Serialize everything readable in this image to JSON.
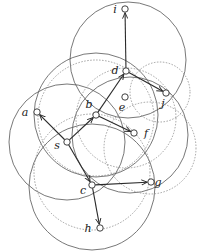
{
  "diagram": {
    "type": "graph-with-coverage-circles",
    "colors": {
      "stroke": "#555555",
      "edge": "#2a2a2a",
      "node_fill": "#ffffff",
      "label": "#222222"
    },
    "nodes": [
      {
        "id": "i",
        "label": "i",
        "x": 125,
        "y": 9,
        "lx": -10,
        "ly": 4
      },
      {
        "id": "d",
        "label": "d",
        "x": 126,
        "y": 71,
        "lx": -11,
        "ly": 3
      },
      {
        "id": "j",
        "label": "j",
        "x": 166,
        "y": 93,
        "lx": -3,
        "ly": 14
      },
      {
        "id": "e",
        "label": "e",
        "x": 125,
        "y": 97,
        "lx": -3,
        "ly": 14
      },
      {
        "id": "a",
        "label": "a",
        "x": 37,
        "y": 112,
        "lx": -12,
        "ly": 4
      },
      {
        "id": "b",
        "label": "b",
        "x": 96,
        "y": 115,
        "lx": -7,
        "ly": -7
      },
      {
        "id": "f",
        "label": "f",
        "x": 134,
        "y": 133,
        "lx": 12,
        "ly": 4
      },
      {
        "id": "s",
        "label": "s",
        "x": 67,
        "y": 142,
        "lx": -10,
        "ly": 7
      },
      {
        "id": "c",
        "label": "c",
        "x": 92,
        "y": 185,
        "lx": -9,
        "ly": 9
      },
      {
        "id": "g",
        "label": "g",
        "x": 151,
        "y": 182,
        "lx": 7,
        "ly": 4
      },
      {
        "id": "h",
        "label": "h",
        "x": 100,
        "y": 228,
        "lx": -12,
        "ly": 4
      }
    ],
    "edges": [
      {
        "from": "s",
        "to": "a"
      },
      {
        "from": "s",
        "to": "b"
      },
      {
        "from": "s",
        "to": "c"
      },
      {
        "from": "b",
        "to": "d"
      },
      {
        "from": "b",
        "to": "f"
      },
      {
        "from": "d",
        "to": "i"
      },
      {
        "from": "d",
        "to": "j"
      },
      {
        "from": "c",
        "to": "g"
      },
      {
        "from": "c",
        "to": "h"
      }
    ],
    "circles": [
      {
        "cx": 128,
        "cy": 60,
        "r": 58,
        "style": "solid"
      },
      {
        "cx": 96,
        "cy": 115,
        "r": 62,
        "style": "solid"
      },
      {
        "cx": 67,
        "cy": 142,
        "r": 58,
        "style": "solid"
      },
      {
        "cx": 92,
        "cy": 187,
        "r": 63,
        "style": "solid"
      },
      {
        "cx": 130,
        "cy": 135,
        "r": 58,
        "style": "solid"
      },
      {
        "cx": 126,
        "cy": 118,
        "r": 50,
        "style": "dashed"
      },
      {
        "cx": 96,
        "cy": 118,
        "r": 58,
        "style": "dashed"
      },
      {
        "cx": 92,
        "cy": 172,
        "r": 58,
        "style": "dashed"
      },
      {
        "cx": 160,
        "cy": 92,
        "r": 30,
        "style": "dashed"
      },
      {
        "cx": 150,
        "cy": 148,
        "r": 46,
        "style": "dashed"
      }
    ]
  }
}
